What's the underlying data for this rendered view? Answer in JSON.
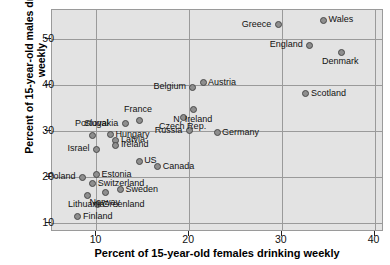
{
  "chart_data": {
    "type": "scatter",
    "title": "",
    "xlabel": "Percent of 15-year-old females drinking weekly",
    "ylabel": "Percent of 15-year-old males drinking weekly",
    "xlim": [
      5.2,
      40.8
    ],
    "ylim": [
      8.5,
      56.2
    ],
    "xticks": [
      10,
      20,
      30,
      40
    ],
    "yticks": [
      10,
      20,
      30,
      40,
      50
    ],
    "grid": true,
    "legend": "none",
    "marker_fill": "#8e8e8e",
    "marker_edge": "#4a4a4a",
    "plot_background": "#e3e3e3",
    "gridline_color": "#9a9a9a",
    "points": [
      {
        "label": "Wales",
        "x": 34.5,
        "y": 54.0,
        "label_pos": "right"
      },
      {
        "label": "Greece",
        "x": 29.6,
        "y": 53.0,
        "label_pos": "left"
      },
      {
        "label": "England",
        "x": 33.0,
        "y": 48.6,
        "label_pos": "left"
      },
      {
        "label": "Denmark",
        "x": 36.4,
        "y": 47.0,
        "label_pos": "below"
      },
      {
        "label": "Austria",
        "x": 21.5,
        "y": 40.4,
        "label_pos": "right"
      },
      {
        "label": "Belgium",
        "x": 20.4,
        "y": 39.5,
        "label_pos": "left"
      },
      {
        "label": "Scotland",
        "x": 32.6,
        "y": 38.0,
        "label_pos": "right"
      },
      {
        "label": "N. Ireland",
        "x": 20.5,
        "y": 34.6,
        "label_pos": "below"
      },
      {
        "label": "Czech Rep.",
        "x": 19.4,
        "y": 33.0,
        "label_pos": "below"
      },
      {
        "label": "France",
        "x": 14.6,
        "y": 32.2,
        "label_pos": "above"
      },
      {
        "label": "Slovakia",
        "x": 13.1,
        "y": 31.5,
        "label_pos": "left"
      },
      {
        "label": "Russia",
        "x": 20.0,
        "y": 30.0,
        "label_pos": "left"
      },
      {
        "label": "Germany",
        "x": 23.0,
        "y": 29.6,
        "label_pos": "right"
      },
      {
        "label": "Portugal",
        "x": 9.6,
        "y": 29.0,
        "label_pos": "above"
      },
      {
        "label": "Hungary",
        "x": 11.5,
        "y": 29.2,
        "label_pos": "right"
      },
      {
        "label": "Latvia",
        "x": 12.1,
        "y": 28.0,
        "label_pos": "right"
      },
      {
        "label": "Ireland",
        "x": 12.1,
        "y": 26.9,
        "label_pos": "right"
      },
      {
        "label": "Israel",
        "x": 10.0,
        "y": 26.0,
        "label_pos": "left"
      },
      {
        "label": "US",
        "x": 14.6,
        "y": 23.4,
        "label_pos": "right"
      },
      {
        "label": "Canada",
        "x": 16.6,
        "y": 22.2,
        "label_pos": "right"
      },
      {
        "label": "Estonia",
        "x": 10.0,
        "y": 20.5,
        "label_pos": "right"
      },
      {
        "label": "Poland",
        "x": 8.5,
        "y": 19.9,
        "label_pos": "left"
      },
      {
        "label": "Switzerland",
        "x": 9.6,
        "y": 18.5,
        "label_pos": "right"
      },
      {
        "label": "Sweden",
        "x": 12.6,
        "y": 17.2,
        "label_pos": "right"
      },
      {
        "label": "Norway",
        "x": 11.0,
        "y": 16.6,
        "label_pos": "below"
      },
      {
        "label": "Lithuania",
        "x": 9.0,
        "y": 16.0,
        "label_pos": "below"
      },
      {
        "label": "Greenland",
        "x": 10.1,
        "y": 14.0,
        "label_pos": "right"
      },
      {
        "label": "Finland",
        "x": 8.0,
        "y": 11.4,
        "label_pos": "right"
      }
    ]
  }
}
